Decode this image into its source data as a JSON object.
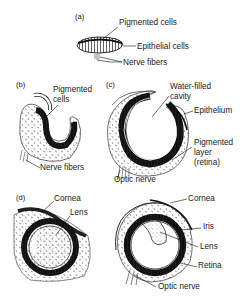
{
  "diagram": {
    "panels": [
      {
        "id": "a",
        "panel_label": "(a)",
        "labels": {
          "pigmented_cells": "Pigmented cells",
          "epithelial_cells": "Epithelial cells",
          "nerve_fibers": "Nerve fibers"
        }
      },
      {
        "id": "b",
        "panel_label": "(b)",
        "labels": {
          "pigmented_line1": "Pigmented",
          "pigmented_line2": "cells",
          "nerve_fibers": "Nerve fibers"
        }
      },
      {
        "id": "c",
        "panel_label": "(c)",
        "labels": {
          "cavity_line1": "Water-filled",
          "cavity_line2": "cavity",
          "epithelium": "Epithelium",
          "pigmented_line1": "Pigmented",
          "pigmented_line2": "layer",
          "pigmented_line3": "(retina)",
          "optic_nerve": "Optic nerve"
        }
      },
      {
        "id": "d",
        "panel_label": "(d)",
        "labels": {
          "cornea": "Cornea",
          "lens": "Lens"
        }
      },
      {
        "id": "e",
        "panel_label": "",
        "labels": {
          "cornea": "Cornea",
          "iris": "Iris",
          "lens": "Lens",
          "retina": "Retina",
          "optic_nerve": "Optic nerve"
        }
      }
    ]
  },
  "colors": {
    "ink": "#1a1a1a",
    "background": "#ffffff",
    "pigment": "#2a2a2a"
  }
}
